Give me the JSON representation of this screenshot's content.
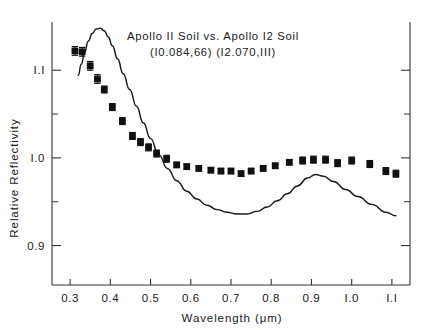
{
  "figure": {
    "title_line1": "Apollo II Soil   vs.   Apollo I2 Soil",
    "title_line2": "(I0.084,66)                (I2.070,III)",
    "title_left_sample": "Apollo II Soil",
    "title_vs": "vs.",
    "title_right_sample": "Apollo I2 Soil",
    "title_left_id": "(I0.084,66)",
    "title_right_id": "(I2.070,III)",
    "background_color": "#ffffff",
    "ink_color": "#1a1a1a"
  },
  "chart_data": {
    "type": "scatter",
    "title": "Apollo II Soil vs. Apollo I2 Soil",
    "subtitle": "(I0.084,66)   (I2.070,III)",
    "xlabel": "Wavelength (μm)",
    "ylabel": "Relative  Reflectivity",
    "xlim": [
      0.255,
      1.145
    ],
    "ylim": [
      0.855,
      1.155
    ],
    "xticks": [
      0.3,
      0.4,
      0.5,
      0.6,
      0.7,
      0.8,
      0.9,
      1.0,
      1.1
    ],
    "xticklabels": [
      "0.3",
      "0.4",
      "0.5",
      "0.6",
      "0.7",
      "0.8",
      "0.9",
      "I.0",
      "I.I"
    ],
    "yticks": [
      0.9,
      1.0,
      1.1
    ],
    "yticklabels": [
      "0.9",
      "I.0",
      "I.I"
    ],
    "y_minor_ticks": [
      0.95,
      1.05
    ],
    "grid": false,
    "legend": false,
    "series": [
      {
        "name": "measured ratio",
        "marker": "square",
        "color": "#111111",
        "has_error_bars": true,
        "x": [
          0.312,
          0.33,
          0.35,
          0.368,
          0.385,
          0.405,
          0.43,
          0.455,
          0.475,
          0.495,
          0.515,
          0.54,
          0.565,
          0.59,
          0.62,
          0.65,
          0.675,
          0.7,
          0.725,
          0.75,
          0.78,
          0.81,
          0.845,
          0.878,
          0.905,
          0.935,
          0.965,
          1.0,
          1.045,
          1.085,
          1.11
        ],
        "y": [
          1.122,
          1.121,
          1.105,
          1.09,
          1.078,
          1.058,
          1.042,
          1.025,
          1.018,
          1.012,
          1.005,
          0.999,
          0.992,
          0.99,
          0.988,
          0.986,
          0.985,
          0.985,
          0.982,
          0.985,
          0.988,
          0.991,
          0.995,
          0.997,
          0.998,
          0.998,
          0.994,
          0.997,
          0.993,
          0.985,
          0.982
        ],
        "yerr": [
          0.005,
          0.005,
          0.005,
          0.005,
          0.004,
          0.004,
          0.004,
          0.004,
          0.004,
          0.004,
          0.004,
          0.004,
          0.003,
          0.003,
          0.003,
          0.003,
          0.003,
          0.003,
          0.003,
          0.003,
          0.003,
          0.003,
          0.003,
          0.004,
          0.004,
          0.004,
          0.004,
          0.004,
          0.004,
          0.004,
          0.004
        ]
      },
      {
        "name": "model curve",
        "marker": "none",
        "color": "#1a1a1a",
        "linewidth": 1.45,
        "x": [
          0.32,
          0.328,
          0.336,
          0.345,
          0.355,
          0.365,
          0.375,
          0.385,
          0.395,
          0.405,
          0.418,
          0.432,
          0.448,
          0.465,
          0.482,
          0.5,
          0.52,
          0.542,
          0.565,
          0.59,
          0.615,
          0.64,
          0.665,
          0.69,
          0.715,
          0.74,
          0.765,
          0.79,
          0.815,
          0.84,
          0.865,
          0.89,
          0.91,
          0.93,
          0.955,
          0.985,
          1.015,
          1.05,
          1.085,
          1.11
        ],
        "y": [
          1.094,
          1.107,
          1.12,
          1.133,
          1.142,
          1.147,
          1.148,
          1.145,
          1.138,
          1.128,
          1.113,
          1.096,
          1.078,
          1.059,
          1.04,
          1.022,
          1.004,
          0.988,
          0.974,
          0.962,
          0.953,
          0.946,
          0.941,
          0.938,
          0.936,
          0.936,
          0.939,
          0.944,
          0.951,
          0.959,
          0.968,
          0.977,
          0.981,
          0.979,
          0.973,
          0.964,
          0.956,
          0.947,
          0.938,
          0.934
        ]
      }
    ]
  }
}
